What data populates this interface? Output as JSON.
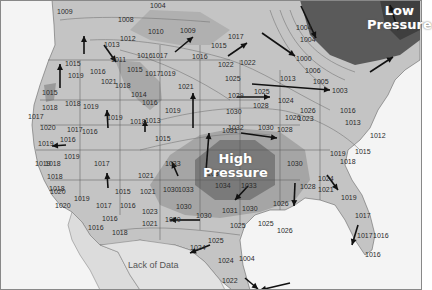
{
  "map": {
    "title": "Surface pressure map of North America",
    "units": "mb",
    "labels": {
      "low": {
        "line1": "Low",
        "line2": "Pressure"
      },
      "high": {
        "line1": "High",
        "line2": "Pressure"
      },
      "lack_of_data": "Lack of Data"
    },
    "colors": {
      "background": "#f4f4f4",
      "land_light": "#c9c9c9",
      "land_mid": "#b3b3b3",
      "land_dark": "#9a9a9a",
      "high_core": "#6f6f6f",
      "low_core": "#4a4a4a",
      "ocean": "#f4f4f4",
      "arrow": "#111111",
      "border": "#555555"
    },
    "isobar_values": [
      {
        "v": "1004",
        "x": 150,
        "y": 2
      },
      {
        "v": "1009",
        "x": 57,
        "y": 8
      },
      {
        "v": "1008",
        "x": 118,
        "y": 16
      },
      {
        "v": "1010",
        "x": 148,
        "y": 28
      },
      {
        "v": "1009",
        "x": 180,
        "y": 27
      },
      {
        "v": "1012",
        "x": 120,
        "y": 35
      },
      {
        "v": "1013",
        "x": 104,
        "y": 41
      },
      {
        "v": "1011",
        "x": 111,
        "y": 56
      },
      {
        "v": "1016",
        "x": 137,
        "y": 52
      },
      {
        "v": "1017",
        "x": 152,
        "y": 52
      },
      {
        "v": "1016",
        "x": 192,
        "y": 53
      },
      {
        "v": "1015",
        "x": 65,
        "y": 60
      },
      {
        "v": "1019",
        "x": 68,
        "y": 72
      },
      {
        "v": "1016",
        "x": 90,
        "y": 68
      },
      {
        "v": "1015",
        "x": 127,
        "y": 66
      },
      {
        "v": "1017",
        "x": 145,
        "y": 70
      },
      {
        "v": "1019",
        "x": 160,
        "y": 70
      },
      {
        "v": "1021",
        "x": 101,
        "y": 78
      },
      {
        "v": "1018",
        "x": 115,
        "y": 82
      },
      {
        "v": "1015",
        "x": 42,
        "y": 89
      },
      {
        "v": "1014",
        "x": 131,
        "y": 91
      },
      {
        "v": "1016",
        "x": 142,
        "y": 99
      },
      {
        "v": "1018",
        "x": 65,
        "y": 100
      },
      {
        "v": "1019",
        "x": 83,
        "y": 103
      },
      {
        "v": "1018",
        "x": 42,
        "y": 104
      },
      {
        "v": "1021",
        "x": 178,
        "y": 83
      },
      {
        "v": "1019",
        "x": 165,
        "y": 107
      },
      {
        "v": "1017",
        "x": 28,
        "y": 113
      },
      {
        "v": "1019",
        "x": 107,
        "y": 114
      },
      {
        "v": "1018",
        "x": 130,
        "y": 118
      },
      {
        "v": "1013",
        "x": 145,
        "y": 117
      },
      {
        "v": "1020",
        "x": 40,
        "y": 124
      },
      {
        "v": "1017",
        "x": 67,
        "y": 126
      },
      {
        "v": "1016",
        "x": 82,
        "y": 128
      },
      {
        "v": "1015",
        "x": 155,
        "y": 135
      },
      {
        "v": "1019",
        "x": 38,
        "y": 140
      },
      {
        "v": "1016",
        "x": 60,
        "y": 136
      },
      {
        "v": "1017",
        "x": 228,
        "y": 33
      },
      {
        "v": "1015",
        "x": 211,
        "y": 42
      },
      {
        "v": "1004",
        "x": 296,
        "y": 24
      },
      {
        "v": "1004",
        "x": 300,
        "y": 36
      },
      {
        "v": "1000",
        "x": 296,
        "y": 55
      },
      {
        "v": "1022",
        "x": 218,
        "y": 61
      },
      {
        "v": "1022",
        "x": 240,
        "y": 59
      },
      {
        "v": "1006",
        "x": 305,
        "y": 67
      },
      {
        "v": "1013",
        "x": 280,
        "y": 75
      },
      {
        "v": "1025",
        "x": 225,
        "y": 75
      },
      {
        "v": "1005",
        "x": 313,
        "y": 78
      },
      {
        "v": "1003",
        "x": 332,
        "y": 87
      },
      {
        "v": "1025",
        "x": 254,
        "y": 88
      },
      {
        "v": "1029",
        "x": 228,
        "y": 92
      },
      {
        "v": "1024",
        "x": 278,
        "y": 97
      },
      {
        "v": "1028",
        "x": 253,
        "y": 102
      },
      {
        "v": "1030",
        "x": 226,
        "y": 108
      },
      {
        "v": "1026",
        "x": 300,
        "y": 107
      },
      {
        "v": "1016",
        "x": 340,
        "y": 107
      },
      {
        "v": "1026",
        "x": 285,
        "y": 114
      },
      {
        "v": "1023",
        "x": 298,
        "y": 115
      },
      {
        "v": "1032",
        "x": 228,
        "y": 124
      },
      {
        "v": "1030",
        "x": 258,
        "y": 124
      },
      {
        "v": "1031",
        "x": 222,
        "y": 127
      },
      {
        "v": "1028",
        "x": 277,
        "y": 126
      },
      {
        "v": "1013",
        "x": 345,
        "y": 119
      },
      {
        "v": "1012",
        "x": 370,
        "y": 132
      },
      {
        "v": "1019",
        "x": 330,
        "y": 150
      },
      {
        "v": "1018",
        "x": 340,
        "y": 158
      },
      {
        "v": "1015",
        "x": 355,
        "y": 148
      },
      {
        "v": "1030",
        "x": 287,
        "y": 160
      },
      {
        "v": "1024",
        "x": 318,
        "y": 175
      },
      {
        "v": "1021",
        "x": 318,
        "y": 186
      },
      {
        "v": "1028",
        "x": 300,
        "y": 183
      },
      {
        "v": "1034",
        "x": 215,
        "y": 182
      },
      {
        "v": "1033",
        "x": 241,
        "y": 182
      },
      {
        "v": "1031",
        "x": 222,
        "y": 207
      },
      {
        "v": "1030",
        "x": 242,
        "y": 205
      },
      {
        "v": "1026",
        "x": 273,
        "y": 200
      },
      {
        "v": "1019",
        "x": 341,
        "y": 194
      },
      {
        "v": "1025",
        "x": 230,
        "y": 222
      },
      {
        "v": "1025",
        "x": 258,
        "y": 220
      },
      {
        "v": "1026",
        "x": 277,
        "y": 227
      },
      {
        "v": "1017",
        "x": 355,
        "y": 212
      },
      {
        "v": "1017",
        "x": 357,
        "y": 232
      },
      {
        "v": "1016",
        "x": 373,
        "y": 232
      },
      {
        "v": "1016",
        "x": 365,
        "y": 251
      },
      {
        "v": "1024",
        "x": 218,
        "y": 257
      },
      {
        "v": "1004",
        "x": 239,
        "y": 255
      },
      {
        "v": "1022",
        "x": 222,
        "y": 277
      },
      {
        "v": "1019",
        "x": 35,
        "y": 160
      },
      {
        "v": "1018",
        "x": 45,
        "y": 160
      },
      {
        "v": "1019",
        "x": 64,
        "y": 153
      },
      {
        "v": "1017",
        "x": 94,
        "y": 160
      },
      {
        "v": "1018",
        "x": 47,
        "y": 173
      },
      {
        "v": "1018",
        "x": 49,
        "y": 185
      },
      {
        "v": "1019",
        "x": 74,
        "y": 195
      },
      {
        "v": "1020",
        "x": 50,
        "y": 188
      },
      {
        "v": "1020",
        "x": 55,
        "y": 202
      },
      {
        "v": "1015",
        "x": 115,
        "y": 188
      },
      {
        "v": "1017",
        "x": 96,
        "y": 202
      },
      {
        "v": "1016",
        "x": 120,
        "y": 202
      },
      {
        "v": "1016",
        "x": 102,
        "y": 215
      },
      {
        "v": "1016",
        "x": 88,
        "y": 224
      },
      {
        "v": "1018",
        "x": 112,
        "y": 229
      },
      {
        "v": "1021",
        "x": 138,
        "y": 172
      },
      {
        "v": "1021",
        "x": 140,
        "y": 188
      },
      {
        "v": "1023",
        "x": 142,
        "y": 208
      },
      {
        "v": "1021",
        "x": 142,
        "y": 220
      },
      {
        "v": "1030",
        "x": 163,
        "y": 186
      },
      {
        "v": "1033",
        "x": 178,
        "y": 186
      },
      {
        "v": "1030",
        "x": 176,
        "y": 203
      },
      {
        "v": "1030",
        "x": 196,
        "y": 212
      },
      {
        "v": "1030",
        "x": 165,
        "y": 216
      },
      {
        "v": "1033",
        "x": 165,
        "y": 160
      },
      {
        "v": "1034",
        "x": 207,
        "y": 170
      },
      {
        "v": "1024",
        "x": 190,
        "y": 244
      },
      {
        "v": "1025",
        "x": 208,
        "y": 237
      }
    ],
    "wind_arrows": [
      {
        "x1": 84,
        "y1": 54,
        "x2": 84,
        "y2": 36
      },
      {
        "x1": 104,
        "y1": 45,
        "x2": 116,
        "y2": 62
      },
      {
        "x1": 60,
        "y1": 88,
        "x2": 60,
        "y2": 64
      },
      {
        "x1": 175,
        "y1": 52,
        "x2": 193,
        "y2": 37
      },
      {
        "x1": 228,
        "y1": 56,
        "x2": 247,
        "y2": 43
      },
      {
        "x1": 262,
        "y1": 33,
        "x2": 295,
        "y2": 56
      },
      {
        "x1": 301,
        "y1": 6,
        "x2": 316,
        "y2": 38
      },
      {
        "x1": 398,
        "y1": 30,
        "x2": 390,
        "y2": 5
      },
      {
        "x1": 370,
        "y1": 72,
        "x2": 393,
        "y2": 57
      },
      {
        "x1": 252,
        "y1": 84,
        "x2": 330,
        "y2": 90
      },
      {
        "x1": 237,
        "y1": 97,
        "x2": 270,
        "y2": 97
      },
      {
        "x1": 193,
        "y1": 128,
        "x2": 193,
        "y2": 93
      },
      {
        "x1": 241,
        "y1": 133,
        "x2": 277,
        "y2": 138
      },
      {
        "x1": 108,
        "y1": 128,
        "x2": 107,
        "y2": 110
      },
      {
        "x1": 145,
        "y1": 132,
        "x2": 145,
        "y2": 120
      },
      {
        "x1": 108,
        "y1": 188,
        "x2": 107,
        "y2": 173
      },
      {
        "x1": 206,
        "y1": 171,
        "x2": 209,
        "y2": 133
      },
      {
        "x1": 178,
        "y1": 176,
        "x2": 172,
        "y2": 162
      },
      {
        "x1": 248,
        "y1": 186,
        "x2": 235,
        "y2": 200
      },
      {
        "x1": 295,
        "y1": 183,
        "x2": 294,
        "y2": 206
      },
      {
        "x1": 327,
        "y1": 175,
        "x2": 338,
        "y2": 190
      },
      {
        "x1": 358,
        "y1": 225,
        "x2": 352,
        "y2": 245
      },
      {
        "x1": 200,
        "y1": 220,
        "x2": 170,
        "y2": 220
      },
      {
        "x1": 210,
        "y1": 245,
        "x2": 190,
        "y2": 253
      },
      {
        "x1": 245,
        "y1": 278,
        "x2": 258,
        "y2": 289
      },
      {
        "x1": 290,
        "y1": 283,
        "x2": 260,
        "y2": 290
      },
      {
        "x1": 66,
        "y1": 145,
        "x2": 52,
        "y2": 146
      }
    ]
  }
}
